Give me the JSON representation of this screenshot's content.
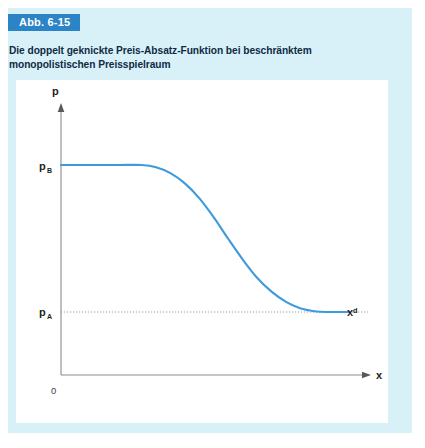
{
  "figure": {
    "badge_label": "Abb. 6-15",
    "caption": "Die doppelt geknickte Preis-Absatz-Funktion bei beschränktem monopolistischen Preisspielraum",
    "panel_color": "#d8f1f9",
    "badge_color": "#2a84c6",
    "caption_color": "#0f2b44",
    "plot_background": "#ffffff"
  },
  "chart_data": {
    "type": "line",
    "title": "Die doppelt geknickte Preis-Absatz-Funktion bei beschränktem monopolistischen Preisspielraum",
    "xlabel": "x",
    "ylabel": "p",
    "grid": false,
    "legend": false,
    "curve_color": "#3d9bd9",
    "axis_color": "#8c8c8c",
    "series": [
      {
        "name": "x^d",
        "annotation": "xᵈ",
        "points": [
          {
            "x": 0.0,
            "y": 1.0
          },
          {
            "x": 0.1,
            "y": 1.0
          },
          {
            "x": 0.2,
            "y": 1.0
          },
          {
            "x": 0.28,
            "y": 1.0
          },
          {
            "x": 0.33,
            "y": 0.985
          },
          {
            "x": 0.38,
            "y": 0.945
          },
          {
            "x": 0.43,
            "y": 0.875
          },
          {
            "x": 0.48,
            "y": 0.775
          },
          {
            "x": 0.53,
            "y": 0.645
          },
          {
            "x": 0.58,
            "y": 0.5
          },
          {
            "x": 0.63,
            "y": 0.36
          },
          {
            "x": 0.68,
            "y": 0.235
          },
          {
            "x": 0.73,
            "y": 0.14
          },
          {
            "x": 0.78,
            "y": 0.07
          },
          {
            "x": 0.83,
            "y": 0.025
          },
          {
            "x": 0.88,
            "y": 0.005
          },
          {
            "x": 0.93,
            "y": 0.0
          },
          {
            "x": 1.0,
            "y": 0.0
          }
        ]
      }
    ],
    "y_ticks": [
      {
        "value": 1.0,
        "label": "p",
        "sublabel": "B"
      },
      {
        "value": 0.0,
        "label": "p",
        "sublabel": "A"
      }
    ],
    "origin_label": "0",
    "reference_lines": [
      {
        "axis": "y",
        "value": 0.0,
        "style": "dotted",
        "color": "#9a9a9a"
      }
    ],
    "axis_labels": {
      "y_axis": "p",
      "x_axis": "x"
    }
  }
}
